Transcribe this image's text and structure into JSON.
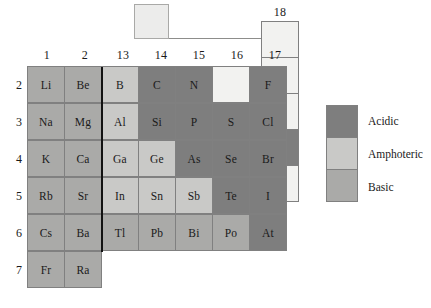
{
  "figure": {
    "type": "periodic-table-diagram"
  },
  "colors": {
    "acidic": "#7e7e7e",
    "amphoteric": "#c9c9c7",
    "basic": "#aaaaa8",
    "blank": "#f2f2f0",
    "border": "#808080",
    "divider": "#121212",
    "background": "#ffffff"
  },
  "hydrogen_box": {
    "label": "",
    "category": "blank"
  },
  "group_headers": [
    "1",
    "2",
    "13",
    "14",
    "15",
    "16",
    "17"
  ],
  "group18_header": "18",
  "period_labels": [
    "2",
    "3",
    "4",
    "5",
    "6",
    "7"
  ],
  "rows": [
    {
      "period": "2",
      "cells": [
        {
          "symbol": "Li",
          "category": "basic"
        },
        {
          "symbol": "Be",
          "category": "basic"
        },
        {
          "symbol": "B",
          "category": "amphoteric"
        },
        {
          "symbol": "C",
          "category": "acidic"
        },
        {
          "symbol": "N",
          "category": "acidic"
        },
        {
          "symbol": "",
          "category": "blank"
        },
        {
          "symbol": "F",
          "category": "acidic"
        }
      ],
      "group18": {
        "symbol": "",
        "category": "blank"
      }
    },
    {
      "period": "3",
      "cells": [
        {
          "symbol": "Na",
          "category": "basic"
        },
        {
          "symbol": "Mg",
          "category": "basic"
        },
        {
          "symbol": "Al",
          "category": "amphoteric"
        },
        {
          "symbol": "Si",
          "category": "acidic"
        },
        {
          "symbol": "P",
          "category": "acidic"
        },
        {
          "symbol": "S",
          "category": "acidic"
        },
        {
          "symbol": "Cl",
          "category": "acidic"
        }
      ],
      "group18": {
        "symbol": "",
        "category": "blank"
      }
    },
    {
      "period": "4",
      "cells": [
        {
          "symbol": "K",
          "category": "basic"
        },
        {
          "symbol": "Ca",
          "category": "basic"
        },
        {
          "symbol": "Ga",
          "category": "amphoteric"
        },
        {
          "symbol": "Ge",
          "category": "amphoteric"
        },
        {
          "symbol": "As",
          "category": "acidic"
        },
        {
          "symbol": "Se",
          "category": "acidic"
        },
        {
          "symbol": "Br",
          "category": "acidic"
        }
      ],
      "group18": {
        "symbol": "",
        "category": "blank"
      }
    },
    {
      "period": "5",
      "cells": [
        {
          "symbol": "Rb",
          "category": "basic"
        },
        {
          "symbol": "Sr",
          "category": "basic"
        },
        {
          "symbol": "In",
          "category": "amphoteric"
        },
        {
          "symbol": "Sn",
          "category": "amphoteric"
        },
        {
          "symbol": "Sb",
          "category": "amphoteric"
        },
        {
          "symbol": "Te",
          "category": "acidic"
        },
        {
          "symbol": "I",
          "category": "acidic"
        }
      ],
      "group18": {
        "symbol": "Xe",
        "category": "acidic"
      }
    },
    {
      "period": "6",
      "cells": [
        {
          "symbol": "Cs",
          "category": "basic"
        },
        {
          "symbol": "Ba",
          "category": "basic"
        },
        {
          "symbol": "Tl",
          "category": "basic"
        },
        {
          "symbol": "Pb",
          "category": "basic"
        },
        {
          "symbol": "Bi",
          "category": "basic"
        },
        {
          "symbol": "Po",
          "category": "basic"
        },
        {
          "symbol": "At",
          "category": "acidic"
        }
      ],
      "group18": {
        "symbol": "",
        "category": "blank"
      }
    },
    {
      "period": "7",
      "cells": [
        {
          "symbol": "Fr",
          "category": "basic"
        },
        {
          "symbol": "Ra",
          "category": "basic"
        },
        {
          "symbol": null,
          "category": "none"
        },
        {
          "symbol": null,
          "category": "none"
        },
        {
          "symbol": null,
          "category": "none"
        },
        {
          "symbol": null,
          "category": "none"
        },
        {
          "symbol": null,
          "category": "none"
        }
      ],
      "group18": null
    }
  ],
  "legend": {
    "items": [
      {
        "label": "Acidic",
        "category": "acidic"
      },
      {
        "label": "Amphoteric",
        "category": "amphoteric"
      },
      {
        "label": "Basic",
        "category": "basic"
      }
    ]
  }
}
